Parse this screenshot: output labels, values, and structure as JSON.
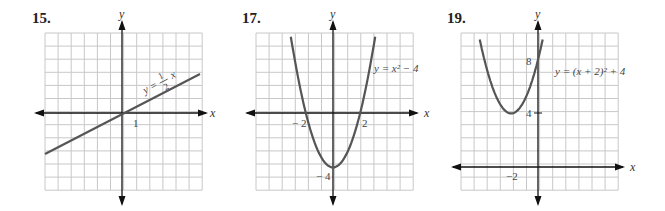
{
  "chart_data": [
    {
      "type": "line",
      "problem_number": "15.",
      "equation_label": "y = 1/2 x",
      "equation_parts": {
        "lhs": "y =",
        "num": "1",
        "den": "2",
        "var": "x"
      },
      "xlabel": "x",
      "ylabel": "y",
      "tick_labels": [
        {
          "axis": "x",
          "value": 1,
          "text": "1"
        }
      ],
      "xlim": [
        -6,
        6
      ],
      "ylim": [
        -6,
        6
      ],
      "grid": true,
      "series": [
        {
          "name": "y = (1/2)x",
          "x": [
            -6,
            6
          ],
          "y": [
            -3,
            3
          ]
        }
      ]
    },
    {
      "type": "line",
      "problem_number": "17.",
      "equation_label": "y = x² − 4",
      "xlabel": "x",
      "ylabel": "y",
      "tick_labels": [
        {
          "axis": "x",
          "value": -2,
          "text": "− 2"
        },
        {
          "axis": "x",
          "value": 2,
          "text": "2"
        },
        {
          "axis": "y",
          "value": -4,
          "text": "− 4"
        }
      ],
      "xlim": [
        -6,
        6
      ],
      "ylim": [
        -6,
        6
      ],
      "grid": true,
      "series": [
        {
          "name": "y = x^2 - 4",
          "x": [
            -3.2,
            -3,
            -2,
            -1,
            0,
            1,
            2,
            3,
            3.2
          ],
          "y": [
            6.24,
            5,
            0,
            -3,
            -4,
            -3,
            0,
            5,
            6.24
          ]
        }
      ]
    },
    {
      "type": "line",
      "problem_number": "19.",
      "equation_label": "y = (x + 2)² + 4",
      "xlabel": "x",
      "ylabel": "y",
      "tick_labels": [
        {
          "axis": "x",
          "value": -2,
          "text": "−2"
        },
        {
          "axis": "y",
          "value": 4,
          "text": "4"
        },
        {
          "axis": "y",
          "value": 8,
          "text": "8"
        }
      ],
      "xlim": [
        -6,
        6
      ],
      "ylim": [
        -2,
        10
      ],
      "grid": true,
      "series": [
        {
          "name": "y = (x+2)^2 + 4",
          "x": [
            -4.4,
            -4,
            -3,
            -2,
            -1,
            0,
            0.4
          ],
          "y": [
            9.76,
            8,
            5,
            4,
            5,
            8,
            9.76
          ]
        }
      ]
    }
  ],
  "colors": {
    "grid": "#c8c8c8",
    "axis": "#111111",
    "curve": "#555555",
    "text": "#444444"
  }
}
